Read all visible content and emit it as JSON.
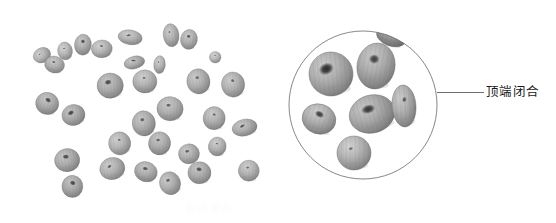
{
  "figure": {
    "type": "botanical-specimen-photo-plate",
    "background_color": "#ffffff",
    "panels": [
      "specimen-photo",
      "magnified-inset"
    ]
  },
  "specimen_photo": {
    "name": "scattered-seeds-photograph",
    "description": "grayscale photograph of scattered ovoid seeds on white background",
    "seed_count": 32,
    "color_light": "#e8e8e8",
    "color_mid": "#b4b4b4",
    "color_dark": "#3a3a3a",
    "seeds": [
      {
        "cx": 38,
        "cy": 78,
        "rx": 17,
        "ry": 14,
        "rot": -28,
        "tone": 0.8,
        "apex": 0.18
      },
      {
        "cx": 62,
        "cy": 96,
        "rx": 19,
        "ry": 16,
        "rot": 14,
        "tone": 0.74,
        "apex": 0.3
      },
      {
        "cx": 82,
        "cy": 70,
        "rx": 14,
        "ry": 17,
        "rot": -8,
        "tone": 0.82,
        "apex": 0.22
      },
      {
        "cx": 116,
        "cy": 58,
        "rx": 16,
        "ry": 20,
        "rot": 6,
        "tone": 0.72,
        "apex": 0.55
      },
      {
        "cx": 152,
        "cy": 66,
        "rx": 20,
        "ry": 17,
        "rot": -4,
        "tone": 0.8,
        "apex": 0.28
      },
      {
        "cx": 206,
        "cy": 44,
        "rx": 23,
        "ry": 14,
        "rot": 8,
        "tone": 0.78,
        "apex": 0.42
      },
      {
        "cx": 284,
        "cy": 40,
        "rx": 15,
        "ry": 22,
        "rot": -6,
        "tone": 0.76,
        "apex": 0.2
      },
      {
        "cx": 318,
        "cy": 48,
        "rx": 16,
        "ry": 19,
        "rot": 10,
        "tone": 0.74,
        "apex": 0.48
      },
      {
        "cx": 368,
        "cy": 82,
        "rx": 11,
        "ry": 11,
        "rot": 0,
        "tone": 0.84,
        "apex": 0.24
      },
      {
        "cx": 214,
        "cy": 92,
        "rx": 20,
        "ry": 12,
        "rot": -14,
        "tone": 0.72,
        "apex": 0.5
      },
      {
        "cx": 262,
        "cy": 96,
        "rx": 11,
        "ry": 17,
        "rot": 4,
        "tone": 0.8,
        "apex": 0.22
      },
      {
        "cx": 168,
        "cy": 136,
        "rx": 25,
        "ry": 24,
        "rot": -4,
        "tone": 0.7,
        "apex": 0.6
      },
      {
        "cx": 234,
        "cy": 128,
        "rx": 23,
        "ry": 22,
        "rot": 6,
        "tone": 0.78,
        "apex": 0.2
      },
      {
        "cx": 336,
        "cy": 128,
        "rx": 22,
        "ry": 24,
        "rot": -10,
        "tone": 0.74,
        "apex": 0.3
      },
      {
        "cx": 48,
        "cy": 170,
        "rx": 22,
        "ry": 21,
        "rot": 16,
        "tone": 0.7,
        "apex": 0.62
      },
      {
        "cx": 98,
        "cy": 192,
        "rx": 22,
        "ry": 20,
        "rot": -12,
        "tone": 0.68,
        "apex": 0.66
      },
      {
        "cx": 282,
        "cy": 180,
        "rx": 25,
        "ry": 23,
        "rot": 4,
        "tone": 0.74,
        "apex": 0.34
      },
      {
        "cx": 232,
        "cy": 208,
        "rx": 22,
        "ry": 24,
        "rot": -6,
        "tone": 0.72,
        "apex": 0.38
      },
      {
        "cx": 366,
        "cy": 198,
        "rx": 21,
        "ry": 22,
        "rot": 8,
        "tone": 0.76,
        "apex": 0.26
      },
      {
        "cx": 186,
        "cy": 246,
        "rx": 21,
        "ry": 22,
        "rot": -8,
        "tone": 0.78,
        "apex": 0.22
      },
      {
        "cx": 262,
        "cy": 246,
        "rx": 21,
        "ry": 22,
        "rot": 12,
        "tone": 0.72,
        "apex": 0.36
      },
      {
        "cx": 318,
        "cy": 266,
        "rx": 20,
        "ry": 19,
        "rot": -6,
        "tone": 0.74,
        "apex": 0.42
      },
      {
        "cx": 372,
        "cy": 252,
        "rx": 17,
        "ry": 18,
        "rot": 10,
        "tone": 0.78,
        "apex": 0.24
      },
      {
        "cx": 86,
        "cy": 278,
        "rx": 24,
        "ry": 22,
        "rot": -10,
        "tone": 0.7,
        "apex": 0.58
      },
      {
        "cx": 96,
        "cy": 328,
        "rx": 20,
        "ry": 21,
        "rot": 6,
        "tone": 0.68,
        "apex": 0.64
      },
      {
        "cx": 172,
        "cy": 294,
        "rx": 24,
        "ry": 21,
        "rot": -14,
        "tone": 0.76,
        "apex": 0.34
      },
      {
        "cx": 236,
        "cy": 300,
        "rx": 22,
        "ry": 19,
        "rot": 18,
        "tone": 0.72,
        "apex": 0.5
      },
      {
        "cx": 282,
        "cy": 322,
        "rx": 20,
        "ry": 22,
        "rot": -18,
        "tone": 0.74,
        "apex": 0.4
      },
      {
        "cx": 338,
        "cy": 302,
        "rx": 22,
        "ry": 21,
        "rot": 4,
        "tone": 0.7,
        "apex": 0.56
      },
      {
        "cx": 402,
        "cy": 134,
        "rx": 22,
        "ry": 24,
        "rot": -6,
        "tone": 0.76,
        "apex": 0.28
      },
      {
        "cx": 424,
        "cy": 216,
        "rx": 24,
        "ry": 16,
        "rot": -12,
        "tone": 0.72,
        "apex": 0.48
      },
      {
        "cx": 432,
        "cy": 298,
        "rx": 20,
        "ry": 20,
        "rot": 8,
        "tone": 0.78,
        "apex": 0.26
      }
    ]
  },
  "magnified_inset": {
    "name": "circular-magnified-detail",
    "shape": "circle",
    "border_color": "#555555",
    "border_width_px": 1,
    "center_x": 363,
    "center_y": 105,
    "radius_px": 75,
    "description": "magnified circular detail showing seed apices",
    "seeds": [
      {
        "cx": 86,
        "cy": 88,
        "rx": 44,
        "ry": 44,
        "rot": -6,
        "tone": 0.74,
        "apex": 0.85
      },
      {
        "cx": 176,
        "cy": 72,
        "rx": 38,
        "ry": 46,
        "rot": 10,
        "tone": 0.72,
        "apex": 0.6
      },
      {
        "cx": 168,
        "cy": 168,
        "rx": 46,
        "ry": 38,
        "rot": -16,
        "tone": 0.7,
        "apex": 0.72
      },
      {
        "cx": 62,
        "cy": 178,
        "rx": 34,
        "ry": 30,
        "rot": 18,
        "tone": 0.76,
        "apex": 0.64
      },
      {
        "cx": 232,
        "cy": 152,
        "rx": 24,
        "ry": 42,
        "rot": -4,
        "tone": 0.74,
        "apex": 0.3
      },
      {
        "cx": 132,
        "cy": 246,
        "rx": 34,
        "ry": 34,
        "rot": 0,
        "tone": 0.8,
        "apex": 0.14
      },
      {
        "cx": 206,
        "cy": 14,
        "rx": 30,
        "ry": 18,
        "rot": 20,
        "tone": 0.46,
        "apex": 0.9
      }
    ]
  },
  "leader_line": {
    "name": "annotation-leader-line",
    "color": "#6e6e6e",
    "from_x": 437,
    "from_y": 92,
    "to_x": 484,
    "to_y": 92
  },
  "annotation": {
    "apex_label": "顶端闭合",
    "text_color": "#1b1b1b"
  },
  "watermark": {
    "text": "标本图片"
  }
}
